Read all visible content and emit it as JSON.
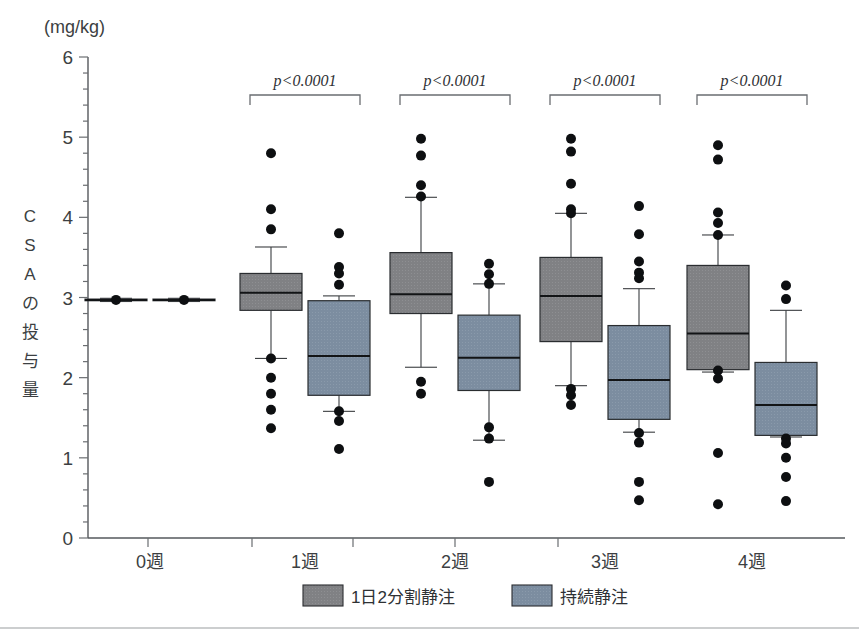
{
  "chart_data": {
    "type": "box",
    "title": "",
    "unit_label": "(mg/kg)",
    "ylabel": "CSAの投与量",
    "ylabel_chars": [
      "C",
      "S",
      "A",
      "の",
      "投",
      "与",
      "量"
    ],
    "xlabel": "",
    "ylim": [
      0,
      6
    ],
    "ytick_labels": [
      "0",
      "1",
      "2",
      "3",
      "4",
      "5",
      "6"
    ],
    "ytick_values": [
      0,
      1,
      2,
      3,
      4,
      5,
      6
    ],
    "yminor_step": 0.2,
    "categories": [
      "0週",
      "1週",
      "2週",
      "3週",
      "4週"
    ],
    "grid": false,
    "legend_position": "bottom",
    "colors": {
      "series_gray": "#808184",
      "series_blue": "#7c8da0",
      "outlier": "#0d0f11",
      "axis": "#55585c",
      "text": "#3c3f42"
    },
    "annotations": [
      {
        "category": "1週",
        "text": "p<0.0001"
      },
      {
        "category": "2週",
        "text": "p<0.0001"
      },
      {
        "category": "3週",
        "text": "p<0.0001"
      },
      {
        "category": "4週",
        "text": "p<0.0001"
      }
    ],
    "series": [
      {
        "name": "1日2分割静注",
        "color": "#808184",
        "boxes": [
          {
            "category": "0週",
            "min": 2.95,
            "q1": 2.96,
            "median": 2.97,
            "q3": 2.98,
            "max": 2.99,
            "outliers": [
              2.97
            ]
          },
          {
            "category": "1週",
            "min": 2.24,
            "q1": 2.84,
            "median": 3.06,
            "q3": 3.3,
            "max": 3.63,
            "outliers": [
              4.8,
              4.1,
              3.85,
              2.24,
              2.0,
              1.8,
              1.6,
              1.37
            ]
          },
          {
            "category": "2週",
            "min": 2.13,
            "q1": 2.8,
            "median": 3.04,
            "q3": 3.56,
            "max": 4.25,
            "outliers": [
              4.98,
              4.77,
              4.4,
              4.26,
              1.95,
              1.8
            ]
          },
          {
            "category": "3週",
            "min": 1.9,
            "q1": 2.45,
            "median": 3.02,
            "q3": 3.5,
            "max": 4.05,
            "outliers": [
              4.98,
              4.82,
              4.42,
              4.1,
              4.05,
              1.86,
              1.78,
              1.66
            ]
          },
          {
            "category": "4週",
            "min": 2.07,
            "q1": 2.1,
            "median": 2.55,
            "q3": 3.4,
            "max": 3.78,
            "outliers": [
              4.9,
              4.72,
              4.06,
              3.93,
              3.78,
              2.09,
              1.99,
              1.06,
              0.42
            ]
          }
        ]
      },
      {
        "name": "持続静注",
        "color": "#7c8da0",
        "boxes": [
          {
            "category": "0週",
            "min": 2.95,
            "q1": 2.96,
            "median": 2.97,
            "q3": 2.98,
            "max": 2.99,
            "outliers": [
              2.97
            ]
          },
          {
            "category": "1週",
            "min": 1.58,
            "q1": 1.78,
            "median": 2.27,
            "q3": 2.96,
            "max": 3.02,
            "outliers": [
              3.8,
              3.38,
              3.3,
              3.16,
              1.58,
              1.46,
              1.11
            ]
          },
          {
            "category": "2週",
            "min": 1.22,
            "q1": 1.84,
            "median": 2.25,
            "q3": 2.78,
            "max": 3.17,
            "outliers": [
              3.42,
              3.29,
              3.17,
              1.38,
              1.24,
              0.7
            ]
          },
          {
            "category": "3週",
            "min": 1.32,
            "q1": 1.48,
            "median": 1.97,
            "q3": 2.65,
            "max": 3.11,
            "outliers": [
              4.14,
              3.79,
              3.45,
              3.31,
              3.24,
              1.31,
              1.19,
              0.7,
              0.47
            ]
          },
          {
            "category": "4週",
            "min": 1.26,
            "q1": 1.28,
            "median": 1.66,
            "q3": 2.19,
            "max": 2.84,
            "outliers": [
              3.15,
              2.98,
              1.24,
              1.18,
              1.0,
              0.76,
              0.46
            ]
          }
        ]
      }
    ],
    "legend": [
      {
        "label": "1日2分割静注",
        "color": "#808184"
      },
      {
        "label": "持続静注",
        "color": "#7c8da0"
      }
    ]
  }
}
